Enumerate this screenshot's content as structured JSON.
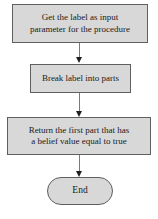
{
  "flowchart": {
    "nodes": [
      {
        "id": "get-label",
        "type": "process",
        "label": "Get the label as input parameter for the procedure",
        "lines": [
          "Get the label as input",
          "parameter for the procedure"
        ]
      },
      {
        "id": "break-label",
        "type": "process",
        "label": "Break label into parts",
        "lines": [
          "Break label into parts"
        ]
      },
      {
        "id": "return-part",
        "type": "process",
        "label": "Return the first part that has a belief value equal to true",
        "lines": [
          "Return the first part that has",
          "a belief value equal to true"
        ]
      },
      {
        "id": "end",
        "type": "terminator",
        "label": "End",
        "lines": [
          "End"
        ]
      }
    ],
    "connections": [
      {
        "from": "get-label",
        "to": "break-label"
      },
      {
        "from": "break-label",
        "to": "return-part"
      },
      {
        "from": "return-part",
        "to": "end"
      }
    ],
    "colors": {
      "background": "#ffffff",
      "node_fill": "#d8d8d8",
      "node_border": "#5f5f5f",
      "text": "#1a1a1a",
      "connector_line": "#7a7a7a",
      "arrowhead": "#1f1f1f"
    }
  }
}
